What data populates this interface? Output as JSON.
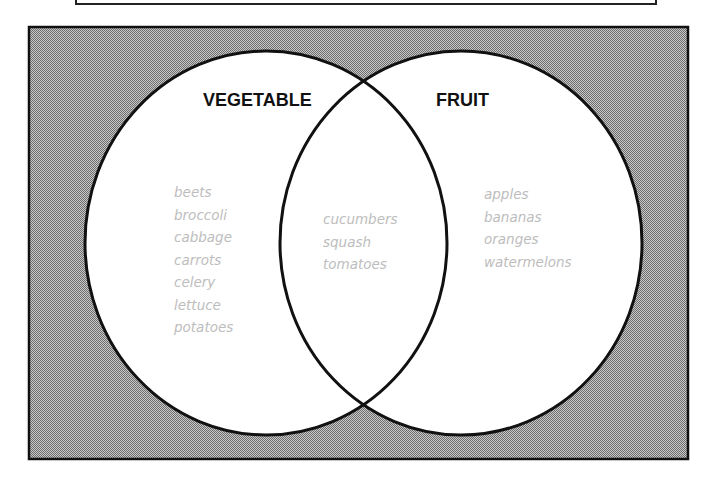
{
  "diagram": {
    "type": "venn",
    "colors": {
      "background_pattern": "#9a9a9a",
      "circle_fill": "#ffffff",
      "outline": "#111111",
      "label_text": "#111111",
      "item_text": "#bdbdbd"
    },
    "sets": [
      {
        "label": "VEGETABLE",
        "only_items": [
          "beets",
          "broccoli",
          "cabbage",
          "carrots",
          "celery",
          "lettuce",
          "potatoes"
        ]
      },
      {
        "label": "FRUIT",
        "only_items": [
          "apples",
          "bananas",
          "oranges",
          "watermelons"
        ]
      }
    ],
    "intersection": {
      "items": [
        "cucumbers",
        "squash",
        "tomatoes"
      ]
    }
  }
}
